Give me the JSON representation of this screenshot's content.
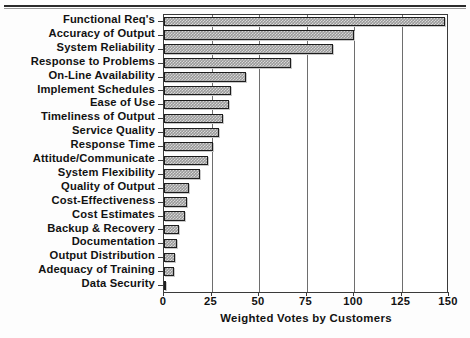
{
  "chart_data": {
    "type": "bar",
    "orientation": "horizontal",
    "title": "",
    "xlabel": "Weighted Votes by Customers",
    "ylabel": "",
    "xlim": [
      0,
      150
    ],
    "xticks": [
      0,
      25,
      50,
      75,
      100,
      125,
      150
    ],
    "grid": "vertical",
    "legend": "none",
    "bar_color": "#9a9a9a",
    "bar_edge_color": "#1d1d1d",
    "categories": [
      "Functional Req's",
      "Accuracy of Output",
      "System Reliability",
      "Response to Problems",
      "On-Line Availability",
      "Implement Schedules",
      "Ease of Use",
      "Timeliness of Output",
      "Service Quality",
      "Response Time",
      "Attitude/Communicate",
      "System Flexibility",
      "Quality of Output",
      "Cost-Effectiveness",
      "Cost Estimates",
      "Backup & Recovery",
      "Documentation",
      "Output Distribution",
      "Adequacy of Training",
      "Data Security"
    ],
    "values": [
      148,
      100,
      89,
      67,
      43,
      35,
      34,
      31,
      29,
      26,
      23,
      19,
      13,
      12,
      11,
      8,
      7,
      6,
      5,
      1
    ]
  }
}
